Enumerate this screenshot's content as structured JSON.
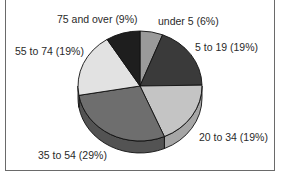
{
  "chart_data": {
    "type": "pie",
    "title": "",
    "style": "3d-pie",
    "categories": [
      "under 5",
      "5 to 19",
      "20 to 34",
      "35 to 54",
      "55 to 74",
      "75 and over"
    ],
    "values": [
      6,
      19,
      19,
      29,
      19,
      9
    ],
    "unit": "%",
    "labels": [
      "under 5 (6%)",
      "5 to 19 (19%)",
      "20 to 34 (19%)",
      "35 to 54 (29%)",
      "55 to 74 (19%)",
      "75 and over (9%)"
    ],
    "colors": [
      "#9a9a9a",
      "#3a3a3a",
      "#c4c4c4",
      "#6e6e6e",
      "#e2e2e2",
      "#1e1e1e"
    ],
    "side_colors": [
      "#7a7a7a",
      "#262626",
      "#a6a6a6",
      "#535353",
      "#c2c2c2",
      "#121212"
    ],
    "legend": "none (direct labels)"
  }
}
